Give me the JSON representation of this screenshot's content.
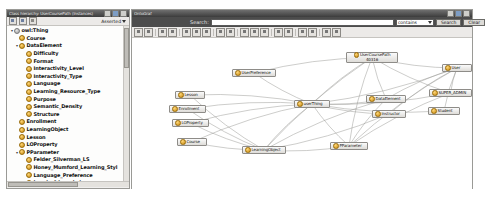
{
  "window": {
    "left_panel_title": "Class hierarchy: UserCoursePath (Instances)",
    "right_panel_title": "OntoGraf"
  },
  "hierarchy": {
    "toolbar": {
      "add_subclass_icon": "add-subclass-icon",
      "add_sibling_icon": "add-sibling-icon",
      "delete_class_icon": "delete-class-icon",
      "view_mode": "Asserted"
    },
    "tree": [
      {
        "label": "owl:Thing",
        "level": 0,
        "twist": "▾",
        "kind": "thing",
        "bold": true
      },
      {
        "label": "Course",
        "level": 1,
        "twist": "",
        "kind": "class",
        "bold": true
      },
      {
        "label": "DataElement",
        "level": 1,
        "twist": "▾",
        "kind": "class",
        "bold": true
      },
      {
        "label": "Difficulty",
        "level": 2,
        "twist": "",
        "kind": "class",
        "bold": true
      },
      {
        "label": "Format",
        "level": 2,
        "twist": "",
        "kind": "class",
        "bold": true
      },
      {
        "label": "Interactivity_Level",
        "level": 2,
        "twist": "",
        "kind": "class",
        "bold": true
      },
      {
        "label": "Interactivity_Type",
        "level": 2,
        "twist": "",
        "kind": "class",
        "bold": true
      },
      {
        "label": "Language",
        "level": 2,
        "twist": "",
        "kind": "class",
        "bold": true
      },
      {
        "label": "Learning_Resource_Type",
        "level": 2,
        "twist": "",
        "kind": "class",
        "bold": true
      },
      {
        "label": "Purpose",
        "level": 2,
        "twist": "",
        "kind": "class",
        "bold": true
      },
      {
        "label": "Semantic_Density",
        "level": 2,
        "twist": "",
        "kind": "class",
        "bold": true
      },
      {
        "label": "Structure",
        "level": 2,
        "twist": "",
        "kind": "class",
        "bold": true
      },
      {
        "label": "Enrollment",
        "level": 1,
        "twist": "",
        "kind": "class",
        "bold": true
      },
      {
        "label": "LearningObject",
        "level": 1,
        "twist": "",
        "kind": "class",
        "bold": true
      },
      {
        "label": "Lesson",
        "level": 1,
        "twist": "",
        "kind": "class",
        "bold": true
      },
      {
        "label": "LOProperty",
        "level": 1,
        "twist": "",
        "kind": "class",
        "bold": true
      },
      {
        "label": "PParameter",
        "level": 1,
        "twist": "▾",
        "kind": "class",
        "bold": true
      },
      {
        "label": "Felder_Silverman_LS",
        "level": 2,
        "twist": "",
        "kind": "class",
        "bold": true
      },
      {
        "label": "Honey_Mumford_Learning_Styl",
        "level": 2,
        "twist": "",
        "kind": "class",
        "bold": true
      },
      {
        "label": "Language_Preference",
        "level": 2,
        "twist": "",
        "kind": "class",
        "bold": true
      },
      {
        "label": "Level_of_knowledge",
        "level": 2,
        "twist": "",
        "kind": "class",
        "bold": true
      },
      {
        "label": "Media_Preference",
        "level": 2,
        "twist": "",
        "kind": "class",
        "bold": true
      },
      {
        "label": "Motivation_Level",
        "level": 2,
        "twist": "",
        "kind": "class",
        "bold": true
      },
      {
        "label": "Navigation_Preference",
        "level": 2,
        "twist": "",
        "kind": "class",
        "bold": true
      },
      {
        "label": "Pedagogical_Approach",
        "level": 2,
        "twist": "",
        "kind": "class",
        "bold": true
      },
      {
        "label": "User",
        "level": 1,
        "twist": "▾",
        "kind": "class",
        "bold": true
      }
    ]
  },
  "ontograf": {
    "search": {
      "label": "Search:",
      "value": "",
      "placeholder": "",
      "match_mode": "contains",
      "search_button": "Search",
      "clear_button": "Clear"
    },
    "toolbar_icons": [
      "home-icon",
      "back-icon",
      "stop-icon",
      "expand-all-icon",
      "edge-style-icon",
      "arc-up-icon",
      "arc-left-icon",
      "tree-layout-icon",
      "radial-layout-icon",
      "zoom-in-icon",
      "zoom-out-icon",
      "zoom-fit-icon",
      "pin-icon",
      "filter-icon",
      "snapshot-icon",
      "grid-icon",
      "export-icon",
      "print-icon"
    ],
    "nodes": [
      {
        "id": "usercoursepath",
        "label": "UserCoursePath",
        "label2": "40316",
        "x": 214,
        "y": 14,
        "w": 52,
        "lines": 2
      },
      {
        "id": "user",
        "label": "User",
        "x": 310,
        "y": 26,
        "w": 30,
        "lines": 1
      },
      {
        "id": "userpreference",
        "label": "UserPreference",
        "x": 100,
        "y": 31,
        "w": 44,
        "lines": 1
      },
      {
        "id": "dataelement",
        "label": "DataElement",
        "x": 234,
        "y": 57,
        "w": 40,
        "lines": 1
      },
      {
        "id": "superadmin",
        "label": "SUPER_ADMIN",
        "x": 297,
        "y": 51,
        "w": 43,
        "lines": 1
      },
      {
        "id": "userthing",
        "label": "userThing",
        "x": 162,
        "y": 62,
        "w": 36,
        "lines": 1
      },
      {
        "id": "lesson",
        "label": "Lesson",
        "x": 43,
        "y": 53,
        "w": 30,
        "lines": 1
      },
      {
        "id": "enrollment",
        "label": "Enrollment",
        "x": 37,
        "y": 67,
        "w": 37,
        "lines": 1
      },
      {
        "id": "loproperty",
        "label": "LOProperty",
        "x": 40,
        "y": 81,
        "w": 37,
        "lines": 1
      },
      {
        "id": "instructor",
        "label": "Instructor",
        "x": 240,
        "y": 72,
        "w": 34,
        "lines": 1
      },
      {
        "id": "student",
        "label": "Student",
        "x": 296,
        "y": 69,
        "w": 32,
        "lines": 1
      },
      {
        "id": "course",
        "label": "Course",
        "x": 45,
        "y": 100,
        "w": 30,
        "lines": 1
      },
      {
        "id": "learningobject",
        "label": "LearningObject",
        "x": 110,
        "y": 108,
        "w": 44,
        "lines": 1
      },
      {
        "id": "pparameter",
        "label": "PParameter",
        "x": 198,
        "y": 104,
        "w": 38,
        "lines": 1
      }
    ],
    "edges": [
      {
        "from": "usercoursepath",
        "to": "userthing"
      },
      {
        "from": "usercoursepath",
        "to": "user"
      },
      {
        "from": "usercoursepath",
        "to": "dataelement"
      },
      {
        "from": "usercoursepath",
        "to": "superadmin"
      },
      {
        "from": "usercoursepath",
        "to": "pparameter"
      },
      {
        "from": "usercoursepath",
        "to": "learningobject"
      },
      {
        "from": "userpreference",
        "to": "userthing"
      },
      {
        "from": "userthing",
        "to": "dataelement"
      },
      {
        "from": "userthing",
        "to": "lesson"
      },
      {
        "from": "userthing",
        "to": "enrollment"
      },
      {
        "from": "userthing",
        "to": "loproperty"
      },
      {
        "from": "userthing",
        "to": "course"
      },
      {
        "from": "userthing",
        "to": "learningobject"
      },
      {
        "from": "userthing",
        "to": "pparameter"
      },
      {
        "from": "userthing",
        "to": "user"
      },
      {
        "from": "userthing",
        "to": "superadmin"
      },
      {
        "from": "userthing",
        "to": "instructor"
      },
      {
        "from": "userthing",
        "to": "student"
      },
      {
        "from": "user",
        "to": "superadmin"
      },
      {
        "from": "user",
        "to": "instructor"
      },
      {
        "from": "user",
        "to": "student"
      },
      {
        "from": "user",
        "to": "dataelement"
      },
      {
        "from": "user",
        "to": "pparameter"
      },
      {
        "from": "dataelement",
        "to": "pparameter"
      },
      {
        "from": "dataelement",
        "to": "learningobject"
      },
      {
        "from": "superadmin",
        "to": "pparameter"
      },
      {
        "from": "lesson",
        "to": "learningobject"
      },
      {
        "from": "enrollment",
        "to": "learningobject"
      },
      {
        "from": "loproperty",
        "to": "learningobject"
      },
      {
        "from": "course",
        "to": "learningobject"
      },
      {
        "from": "learningobject",
        "to": "pparameter"
      },
      {
        "from": "learningobject",
        "to": "instructor"
      },
      {
        "from": "usercoursepath",
        "to": "userpreference"
      }
    ]
  }
}
